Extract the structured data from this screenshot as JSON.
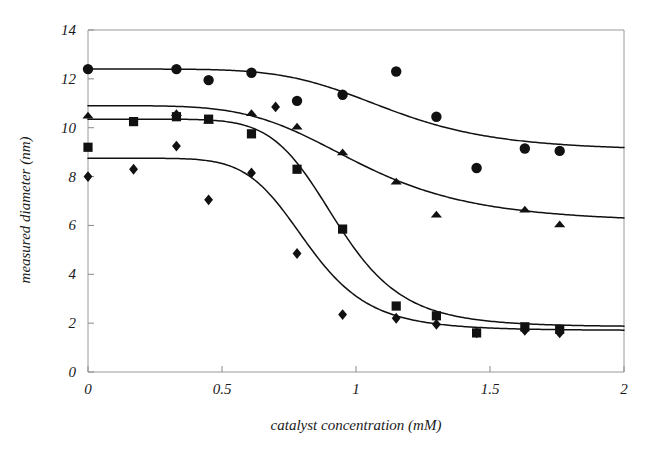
{
  "chart_data": {
    "type": "scatter",
    "title": "",
    "subtitle": "",
    "xlabel": "catalyst concentration (mM)",
    "ylabel": "measured diameter (nm)",
    "xlim": [
      0,
      2
    ],
    "ylim": [
      0,
      14
    ],
    "xticks": [
      0,
      0.5,
      1,
      1.5,
      2
    ],
    "xtick_labels": [
      "0",
      "0.5",
      "1",
      "1.5",
      "2"
    ],
    "yticks": [
      0,
      2,
      4,
      6,
      8,
      10,
      12,
      14
    ],
    "ytick_labels": [
      "0",
      "2",
      "4",
      "6",
      "8",
      "10",
      "12",
      "14"
    ],
    "grid": false,
    "legend": "none",
    "frame": true,
    "marker_color": "#111111",
    "curve_color": "#111111",
    "series": [
      {
        "name": "circle-series",
        "marker": "circle",
        "points": [
          {
            "x": 0.0,
            "y": 12.4
          },
          {
            "x": 0.33,
            "y": 12.4
          },
          {
            "x": 0.45,
            "y": 11.95
          },
          {
            "x": 0.61,
            "y": 12.25
          },
          {
            "x": 0.78,
            "y": 11.1
          },
          {
            "x": 0.95,
            "y": 11.35
          },
          {
            "x": 1.15,
            "y": 12.3
          },
          {
            "x": 1.3,
            "y": 10.45
          },
          {
            "x": 1.45,
            "y": 8.35
          },
          {
            "x": 1.63,
            "y": 9.15
          },
          {
            "x": 1.76,
            "y": 9.05
          }
        ],
        "fit": {
          "top": 12.4,
          "bottom": 9.05,
          "ec50": 1.13,
          "hill": 5.5
        }
      },
      {
        "name": "triangle-series",
        "marker": "triangle",
        "points": [
          {
            "x": 0.0,
            "y": 10.5
          },
          {
            "x": 0.33,
            "y": 10.6
          },
          {
            "x": 0.45,
            "y": 10.3
          },
          {
            "x": 0.61,
            "y": 10.6
          },
          {
            "x": 0.78,
            "y": 10.05
          },
          {
            "x": 0.95,
            "y": 9.0
          },
          {
            "x": 1.15,
            "y": 7.8
          },
          {
            "x": 1.3,
            "y": 6.45
          },
          {
            "x": 1.63,
            "y": 6.65
          },
          {
            "x": 1.76,
            "y": 6.05
          }
        ],
        "fit": {
          "top": 10.9,
          "bottom": 6.1,
          "ec50": 1.02,
          "hill": 4.6
        }
      },
      {
        "name": "square-series",
        "marker": "square",
        "points": [
          {
            "x": 0.0,
            "y": 9.2
          },
          {
            "x": 0.17,
            "y": 10.25
          },
          {
            "x": 0.33,
            "y": 10.45
          },
          {
            "x": 0.45,
            "y": 10.35
          },
          {
            "x": 0.61,
            "y": 9.75
          },
          {
            "x": 0.78,
            "y": 8.3
          },
          {
            "x": 0.95,
            "y": 5.85
          },
          {
            "x": 1.15,
            "y": 2.7
          },
          {
            "x": 1.3,
            "y": 2.3
          },
          {
            "x": 1.45,
            "y": 1.6
          },
          {
            "x": 1.63,
            "y": 1.85
          },
          {
            "x": 1.76,
            "y": 1.75
          }
        ],
        "fit": {
          "top": 10.35,
          "bottom": 1.85,
          "ec50": 0.93,
          "hill": 7.5
        }
      },
      {
        "name": "diamond-series",
        "marker": "diamond",
        "points": [
          {
            "x": 0.0,
            "y": 8.0
          },
          {
            "x": 0.17,
            "y": 8.3
          },
          {
            "x": 0.33,
            "y": 9.25
          },
          {
            "x": 0.45,
            "y": 7.05
          },
          {
            "x": 0.61,
            "y": 8.15
          },
          {
            "x": 0.7,
            "y": 10.85
          },
          {
            "x": 0.78,
            "y": 4.85
          },
          {
            "x": 0.95,
            "y": 2.35
          },
          {
            "x": 1.15,
            "y": 2.2
          },
          {
            "x": 1.3,
            "y": 1.95
          },
          {
            "x": 1.45,
            "y": 1.6
          },
          {
            "x": 1.63,
            "y": 1.7
          },
          {
            "x": 1.76,
            "y": 1.6
          }
        ],
        "fit": {
          "top": 8.75,
          "bottom": 1.7,
          "ec50": 0.82,
          "hill": 7.0
        }
      }
    ]
  },
  "axes": {
    "x_title": "catalyst concentration (mM)",
    "y_title": "measured diameter (nm)"
  }
}
